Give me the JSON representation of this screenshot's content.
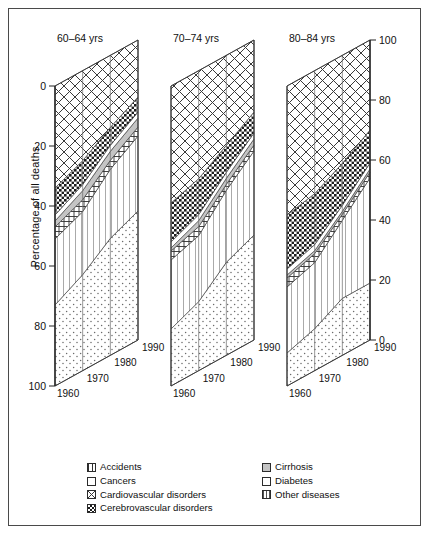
{
  "figure": {
    "ylabel": "Percentage of all deaths",
    "left_axis_ticks": [
      "0",
      "20",
      "40",
      "60",
      "80",
      "100"
    ],
    "right_axis_ticks": [
      "100",
      "80",
      "60",
      "40",
      "20",
      "0"
    ],
    "year_ticks": [
      "1960",
      "1970",
      "1980",
      "1990"
    ]
  },
  "panels": [
    {
      "title": "60–64 yrs"
    },
    {
      "title": "70–74 yrs"
    },
    {
      "title": "80–84 yrs"
    }
  ],
  "legend": {
    "left_column": [
      {
        "label": "Accidents",
        "pattern": "accidents-hatch",
        "color": "#ffffff"
      },
      {
        "label": "Cancers",
        "pattern": "cancers-dots",
        "color": "#ffffff"
      },
      {
        "label": "Cardiovascular disorders",
        "pattern": "cardio-cross",
        "color": "#ffffff"
      },
      {
        "label": "Cerebrovascular disorders",
        "pattern": "cerebro-check",
        "color": "#ffffff"
      }
    ],
    "right_column": [
      {
        "label": "Cirrhosis",
        "pattern": "cirrhosis-solid",
        "color": "#c9c9c9"
      },
      {
        "label": "Diabetes",
        "pattern": "diabetes-blank",
        "color": "#ffffff"
      },
      {
        "label": "Other diseases",
        "pattern": "other-vertical",
        "color": "#ffffff"
      }
    ]
  },
  "chart_data": {
    "type": "area",
    "title": "",
    "subtitle": "",
    "xlabel": "",
    "ylabel": "Percentage of all deaths",
    "x": [
      1960,
      1970,
      1980,
      1990
    ],
    "ylim": [
      0,
      100
    ],
    "grid": true,
    "legend_position": "bottom",
    "stack_order_top_to_bottom": [
      "Cardiovascular disorders",
      "Cerebrovascular disorders",
      "Diabetes",
      "Cirrhosis",
      "Accidents",
      "Other diseases",
      "Cancers"
    ],
    "note": "Pseudo-3D stacked area panels; each panel sums to 100 percent of all deaths. Values are percentage shares read from the axes.",
    "panels": [
      {
        "name": "60–64 yrs",
        "series": [
          {
            "name": "Cardiovascular disorders",
            "values": [
              34,
              30,
              24,
              19
            ]
          },
          {
            "name": "Cerebrovascular disorders",
            "values": [
              9,
              8,
              6,
              5
            ]
          },
          {
            "name": "Diabetes",
            "values": [
              2,
              2,
              2,
              2
            ]
          },
          {
            "name": "Cirrhosis",
            "values": [
              2,
              3,
              3,
              3
            ]
          },
          {
            "name": "Accidents",
            "values": [
              4,
              4,
              3,
              3
            ]
          },
          {
            "name": "Other diseases",
            "values": [
              22,
              21,
              23,
              25
            ]
          },
          {
            "name": "Cancers",
            "values": [
              27,
              32,
              39,
              43
            ]
          }
        ]
      },
      {
        "name": "70–74 yrs",
        "series": [
          {
            "name": "Cardiovascular disorders",
            "values": [
              39,
              36,
              30,
              24
            ]
          },
          {
            "name": "Cerebrovascular disorders",
            "values": [
              13,
              12,
              9,
              7
            ]
          },
          {
            "name": "Diabetes",
            "values": [
              2,
              2,
              2,
              2
            ]
          },
          {
            "name": "Cirrhosis",
            "values": [
              1,
              2,
              2,
              2
            ]
          },
          {
            "name": "Accidents",
            "values": [
              3,
              3,
              2,
              2
            ]
          },
          {
            "name": "Other diseases",
            "values": [
              23,
              22,
              24,
              28
            ]
          },
          {
            "name": "Cancers",
            "values": [
              19,
              23,
              31,
              35
            ]
          }
        ]
      },
      {
        "name": "80–84 yrs",
        "series": [
          {
            "name": "Cardiovascular disorders",
            "values": [
              43,
              41,
              36,
              30
            ]
          },
          {
            "name": "Cerebrovascular disorders",
            "values": [
              18,
              17,
              14,
              11
            ]
          },
          {
            "name": "Diabetes",
            "values": [
              2,
              2,
              2,
              2
            ]
          },
          {
            "name": "Cirrhosis",
            "values": [
              1,
              1,
              1,
              1
            ]
          },
          {
            "name": "Accidents",
            "values": [
              3,
              3,
              2,
              2
            ]
          },
          {
            "name": "Other diseases",
            "values": [
              22,
              22,
              26,
              35
            ]
          },
          {
            "name": "Cancers",
            "values": [
              11,
              14,
              19,
              19
            ]
          }
        ]
      }
    ]
  }
}
